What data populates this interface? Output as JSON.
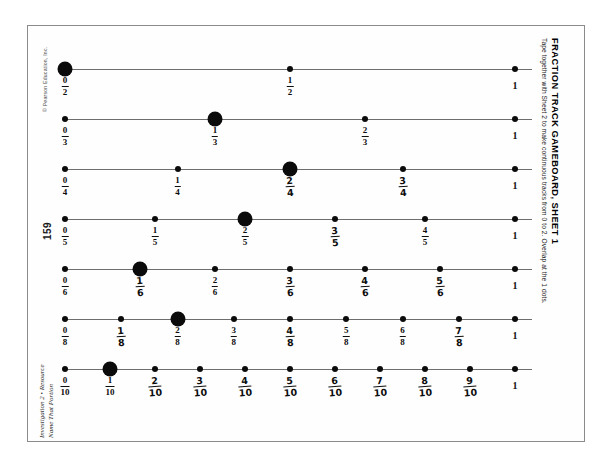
{
  "sheet": {
    "title": "FRACTION TRACK GAMEBOARD, SHEET 1",
    "subtitle": "Tape together with Sheet 2 to make continuous tracks from 0 to 2. Overlap at the 1 dots.",
    "copyright": "© Pearson Education, Inc.",
    "page_number": "159",
    "footer_line1": "Investigation 2 • Resource",
    "footer_line2": "Name That Portion",
    "border_color": "#8b8b8b",
    "line_color": "#6d6d6d",
    "dot_color": "#0b0b0b"
  },
  "tracks": [
    {
      "name": "halves",
      "denominator": 2,
      "marked_index": 0,
      "points": [
        {
          "label_num": "0",
          "label_den": "2",
          "value": 0,
          "marked": true,
          "hand": false
        },
        {
          "label_num": "1",
          "label_den": "2",
          "value": 0.5,
          "marked": false,
          "hand": false
        },
        {
          "whole": "1",
          "value": 1,
          "marked": false,
          "hand": false
        }
      ]
    },
    {
      "name": "thirds",
      "denominator": 3,
      "marked_index": 1,
      "points": [
        {
          "label_num": "0",
          "label_den": "3",
          "value": 0,
          "marked": false,
          "hand": false
        },
        {
          "label_num": "1",
          "label_den": "3",
          "value": 0.3333,
          "marked": true,
          "hand": false
        },
        {
          "label_num": "2",
          "label_den": "3",
          "value": 0.6667,
          "marked": false,
          "hand": false
        },
        {
          "whole": "1",
          "value": 1,
          "marked": false,
          "hand": false
        }
      ]
    },
    {
      "name": "fourths",
      "denominator": 4,
      "marked_index": 2,
      "points": [
        {
          "label_num": "0",
          "label_den": "4",
          "value": 0,
          "marked": false,
          "hand": false
        },
        {
          "label_num": "1",
          "label_den": "4",
          "value": 0.25,
          "marked": false,
          "hand": false
        },
        {
          "label_num": "2",
          "label_den": "4",
          "value": 0.5,
          "marked": true,
          "hand": true
        },
        {
          "label_num": "3",
          "label_den": "4",
          "value": 0.75,
          "marked": false,
          "hand": true
        },
        {
          "whole": "1",
          "value": 1,
          "marked": false,
          "hand": false
        }
      ]
    },
    {
      "name": "fifths",
      "denominator": 5,
      "marked_index": 2,
      "points": [
        {
          "label_num": "0",
          "label_den": "5",
          "value": 0,
          "marked": false,
          "hand": false
        },
        {
          "label_num": "1",
          "label_den": "5",
          "value": 0.2,
          "marked": false,
          "hand": false
        },
        {
          "label_num": "2",
          "label_den": "5",
          "value": 0.4,
          "marked": true,
          "hand": false
        },
        {
          "label_num": "3",
          "label_den": "5",
          "value": 0.6,
          "marked": false,
          "hand": true
        },
        {
          "label_num": "4",
          "label_den": "5",
          "value": 0.8,
          "marked": false,
          "hand": false
        },
        {
          "whole": "1",
          "value": 1,
          "marked": false,
          "hand": false
        }
      ]
    },
    {
      "name": "sixths",
      "denominator": 6,
      "marked_index": 1,
      "points": [
        {
          "label_num": "0",
          "label_den": "6",
          "value": 0,
          "marked": false,
          "hand": false
        },
        {
          "label_num": "1",
          "label_den": "6",
          "value": 0.1667,
          "marked": true,
          "hand": true
        },
        {
          "label_num": "2",
          "label_den": "6",
          "value": 0.3333,
          "marked": false,
          "hand": false
        },
        {
          "label_num": "3",
          "label_den": "6",
          "value": 0.5,
          "marked": false,
          "hand": true
        },
        {
          "label_num": "4",
          "label_den": "6",
          "value": 0.6667,
          "marked": false,
          "hand": true
        },
        {
          "label_num": "5",
          "label_den": "6",
          "value": 0.8333,
          "marked": false,
          "hand": true
        },
        {
          "whole": "1",
          "value": 1,
          "marked": false,
          "hand": false
        }
      ]
    },
    {
      "name": "eighths",
      "denominator": 8,
      "marked_index": 2,
      "points": [
        {
          "label_num": "0",
          "label_den": "8",
          "value": 0,
          "marked": false,
          "hand": false
        },
        {
          "label_num": "1",
          "label_den": "8",
          "value": 0.125,
          "marked": false,
          "hand": true
        },
        {
          "label_num": "2",
          "label_den": "8",
          "value": 0.25,
          "marked": true,
          "hand": false
        },
        {
          "label_num": "3",
          "label_den": "8",
          "value": 0.375,
          "marked": false,
          "hand": false
        },
        {
          "label_num": "4",
          "label_den": "8",
          "value": 0.5,
          "marked": false,
          "hand": true
        },
        {
          "label_num": "5",
          "label_den": "8",
          "value": 0.625,
          "marked": false,
          "hand": false
        },
        {
          "label_num": "6",
          "label_den": "8",
          "value": 0.75,
          "marked": false,
          "hand": false
        },
        {
          "label_num": "7",
          "label_den": "8",
          "value": 0.875,
          "marked": false,
          "hand": true
        },
        {
          "whole": "1",
          "value": 1,
          "marked": false,
          "hand": false
        }
      ]
    },
    {
      "name": "tenths",
      "denominator": 10,
      "marked_index": 1,
      "points": [
        {
          "label_num": "0",
          "label_den": "10",
          "value": 0,
          "marked": false,
          "hand": false
        },
        {
          "label_num": "1",
          "label_den": "10",
          "value": 0.1,
          "marked": true,
          "hand": false
        },
        {
          "label_num": "2",
          "label_den": "10",
          "value": 0.2,
          "marked": false,
          "hand": true
        },
        {
          "label_num": "3",
          "label_den": "10",
          "value": 0.3,
          "marked": false,
          "hand": true
        },
        {
          "label_num": "4",
          "label_den": "10",
          "value": 0.4,
          "marked": false,
          "hand": true
        },
        {
          "label_num": "5",
          "label_den": "10",
          "value": 0.5,
          "marked": false,
          "hand": true
        },
        {
          "label_num": "6",
          "label_den": "10",
          "value": 0.6,
          "marked": false,
          "hand": true
        },
        {
          "label_num": "7",
          "label_den": "10",
          "value": 0.7,
          "marked": false,
          "hand": true
        },
        {
          "label_num": "8",
          "label_den": "10",
          "value": 0.8,
          "marked": false,
          "hand": true
        },
        {
          "label_num": "9",
          "label_den": "10",
          "value": 0.9,
          "marked": false,
          "hand": true
        },
        {
          "whole": "1",
          "value": 1,
          "marked": false,
          "hand": false
        }
      ]
    }
  ],
  "geometry": {
    "track_left_px": 65,
    "track_right_px": 515,
    "line_overshoot_px": 17,
    "first_track_top_px": 55,
    "track_spacing_px": 50
  }
}
